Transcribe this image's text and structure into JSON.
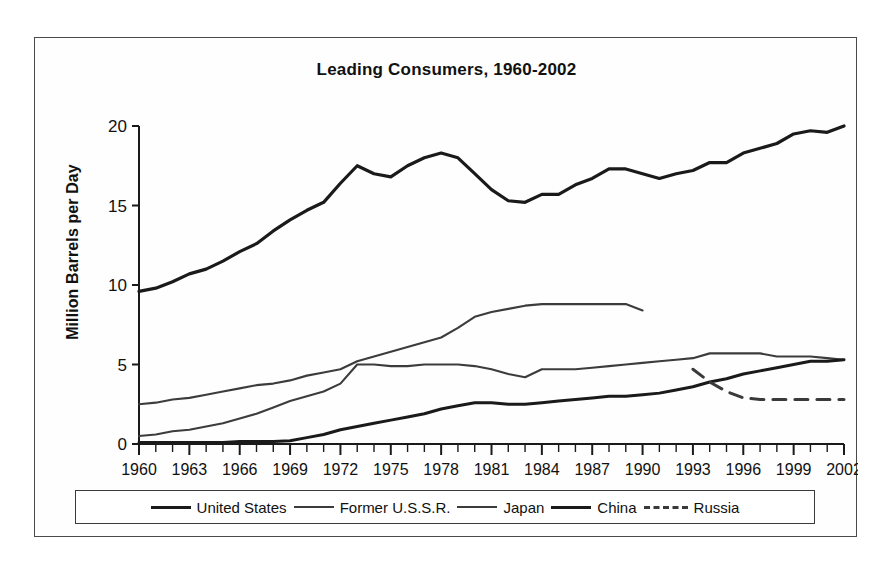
{
  "chart_data": {
    "type": "line",
    "title": "Leading Consumers, 1960-2002",
    "xlabel": "",
    "ylabel": "Million Barrels per Day",
    "xlim": [
      1960,
      2002
    ],
    "ylim": [
      0,
      20
    ],
    "grid": false,
    "legend_position": "bottom",
    "y_ticks": [
      "0",
      "5",
      "10",
      "15",
      "20"
    ],
    "y_tick_values": [
      0,
      5,
      10,
      15,
      20
    ],
    "x_ticks": [
      "1960",
      "1963",
      "1966",
      "1969",
      "1972",
      "1975",
      "1978",
      "1981",
      "1984",
      "1987",
      "1990",
      "1993",
      "1996",
      "1999",
      "2002"
    ],
    "x_tick_values": [
      1960,
      1963,
      1966,
      1969,
      1972,
      1975,
      1978,
      1981,
      1984,
      1987,
      1990,
      1993,
      1996,
      1999,
      2002
    ],
    "x_minor_tick_step": 1,
    "series": [
      {
        "name": "United States",
        "style": "solid",
        "width": 3.2,
        "color": "#1a1a1a",
        "x": [
          1960,
          1961,
          1962,
          1963,
          1964,
          1965,
          1966,
          1967,
          1968,
          1969,
          1970,
          1971,
          1972,
          1973,
          1974,
          1975,
          1976,
          1977,
          1978,
          1979,
          1980,
          1981,
          1982,
          1983,
          1984,
          1985,
          1986,
          1987,
          1988,
          1989,
          1990,
          1991,
          1992,
          1993,
          1994,
          1995,
          1996,
          1997,
          1998,
          1999,
          2000,
          2001,
          2002
        ],
        "y": [
          9.6,
          9.8,
          10.2,
          10.7,
          11.0,
          11.5,
          12.1,
          12.6,
          13.4,
          14.1,
          14.7,
          15.2,
          16.4,
          17.5,
          17.0,
          16.8,
          17.5,
          18.0,
          18.3,
          18.0,
          17.0,
          16.0,
          15.3,
          15.2,
          15.7,
          15.7,
          16.3,
          16.7,
          17.3,
          17.3,
          17.0,
          16.7,
          17.0,
          17.2,
          17.7,
          17.7,
          18.3,
          18.6,
          18.9,
          19.5,
          19.7,
          19.6,
          20.0
        ]
      },
      {
        "name": "Former U.S.S.R.",
        "style": "solid",
        "width": 2.1,
        "color": "#3c3c3c",
        "x": [
          1960,
          1961,
          1962,
          1963,
          1964,
          1965,
          1966,
          1967,
          1968,
          1969,
          1970,
          1971,
          1972,
          1973,
          1974,
          1975,
          1976,
          1977,
          1978,
          1979,
          1980,
          1981,
          1982,
          1983,
          1984,
          1985,
          1986,
          1987,
          1988,
          1989,
          1990
        ],
        "y": [
          2.5,
          2.6,
          2.8,
          2.9,
          3.1,
          3.3,
          3.5,
          3.7,
          3.8,
          4.0,
          4.3,
          4.5,
          4.7,
          5.2,
          5.5,
          5.8,
          6.1,
          6.4,
          6.7,
          7.3,
          8.0,
          8.3,
          8.5,
          8.7,
          8.8,
          8.8,
          8.8,
          8.8,
          8.8,
          8.8,
          8.4
        ]
      },
      {
        "name": "Japan",
        "style": "solid",
        "width": 2.1,
        "color": "#3c3c3c",
        "x": [
          1960,
          1961,
          1962,
          1963,
          1964,
          1965,
          1966,
          1967,
          1968,
          1969,
          1970,
          1971,
          1972,
          1973,
          1974,
          1975,
          1976,
          1977,
          1978,
          1979,
          1980,
          1981,
          1982,
          1983,
          1984,
          1985,
          1986,
          1987,
          1988,
          1989,
          1990,
          1991,
          1992,
          1993,
          1994,
          1995,
          1996,
          1997,
          1998,
          1999,
          2000,
          2001,
          2002
        ],
        "y": [
          0.5,
          0.6,
          0.8,
          0.9,
          1.1,
          1.3,
          1.6,
          1.9,
          2.3,
          2.7,
          3.0,
          3.3,
          3.8,
          5.0,
          5.0,
          4.9,
          4.9,
          5.0,
          5.0,
          5.0,
          4.9,
          4.7,
          4.4,
          4.2,
          4.7,
          4.7,
          4.7,
          4.8,
          4.9,
          5.0,
          5.1,
          5.2,
          5.3,
          5.4,
          5.7,
          5.7,
          5.7,
          5.7,
          5.5,
          5.5,
          5.5,
          5.4,
          5.3
        ]
      },
      {
        "name": "China",
        "style": "solid",
        "width": 3.0,
        "color": "#1a1a1a",
        "x": [
          1960,
          1961,
          1962,
          1963,
          1964,
          1965,
          1966,
          1967,
          1968,
          1969,
          1970,
          1971,
          1972,
          1973,
          1974,
          1975,
          1976,
          1977,
          1978,
          1979,
          1980,
          1981,
          1982,
          1983,
          1984,
          1985,
          1986,
          1987,
          1988,
          1989,
          1990,
          1991,
          1992,
          1993,
          1994,
          1995,
          1996,
          1997,
          1998,
          1999,
          2000,
          2001,
          2002
        ],
        "y": [
          0.1,
          0.1,
          0.1,
          0.1,
          0.1,
          0.1,
          0.15,
          0.15,
          0.15,
          0.2,
          0.4,
          0.6,
          0.9,
          1.1,
          1.3,
          1.5,
          1.7,
          1.9,
          2.2,
          2.4,
          2.6,
          2.6,
          2.5,
          2.5,
          2.6,
          2.7,
          2.8,
          2.9,
          3.0,
          3.0,
          3.1,
          3.2,
          3.4,
          3.6,
          3.9,
          4.1,
          4.4,
          4.6,
          4.8,
          5.0,
          5.2,
          5.2,
          5.3
        ]
      },
      {
        "name": "Russia",
        "style": "dashed",
        "width": 3.0,
        "color": "#3a3a3a",
        "x": [
          1993,
          1994,
          1995,
          1996,
          1997,
          1998,
          1999,
          2000,
          2001,
          2002
        ],
        "y": [
          4.7,
          3.9,
          3.3,
          2.9,
          2.8,
          2.8,
          2.8,
          2.8,
          2.8,
          2.8
        ]
      }
    ]
  },
  "legend": {
    "entries": [
      {
        "label": "United States",
        "swatch": "solid-thick"
      },
      {
        "label": "Former U.S.S.R.",
        "swatch": "solid-thin"
      },
      {
        "label": "Japan",
        "swatch": "solid-thin"
      },
      {
        "label": "China",
        "swatch": "solid-thick"
      },
      {
        "label": "Russia",
        "swatch": "dashed"
      }
    ]
  },
  "colors": {
    "frame": "#4a4a4a",
    "axis": "#1a1a1a",
    "background": "#ffffff"
  }
}
